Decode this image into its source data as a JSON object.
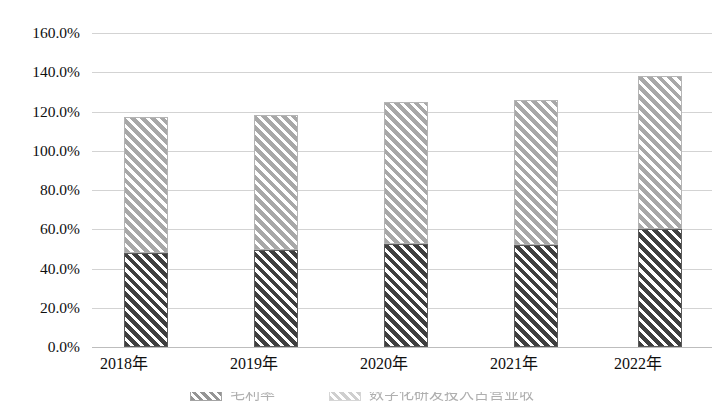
{
  "chart_data": {
    "type": "bar",
    "stacked": true,
    "title": "",
    "xlabel": "",
    "ylabel": "",
    "categories": [
      "2018年",
      "2019年",
      "2020年",
      "2021年",
      "2022年"
    ],
    "series": [
      {
        "name": "毛利率",
        "pattern": "dark-diagonal-hatch",
        "color": "#3f3f3f",
        "values": [
          48.0,
          49.5,
          52.5,
          52.0,
          60.0
        ]
      },
      {
        "name": "数字化研发投入占营业收",
        "pattern": "light-diagonal-hatch",
        "color": "#a8a8a8",
        "values": [
          69.0,
          68.5,
          72.5,
          74.0,
          78.0
        ]
      }
    ],
    "totals": [
      117.0,
      118.0,
      125.0,
      126.0,
      138.0
    ],
    "ylim": [
      0,
      160
    ],
    "ytick_labels": [
      "160.0%",
      "140.0%",
      "120.0%",
      "100.0%",
      "80.0%",
      "60.0%",
      "40.0%",
      "20.0%",
      "0.0%"
    ],
    "ytick_values": [
      160,
      140,
      120,
      100,
      80,
      60,
      40,
      20,
      0
    ],
    "grid": true,
    "legend_position": "bottom",
    "legend_clipped": true
  },
  "legend": {
    "items": [
      {
        "label": "毛利率",
        "swatch": "dark"
      },
      {
        "label": "数字化研发投入占营业收",
        "swatch": "light"
      }
    ]
  }
}
